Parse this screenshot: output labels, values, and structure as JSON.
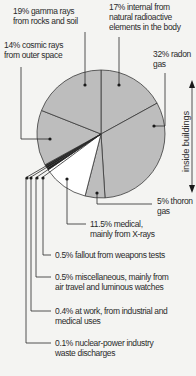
{
  "chart_data": {
    "type": "pie",
    "title": "",
    "start_angle_deg": 0,
    "direction": "clockwise",
    "slices": [
      {
        "key": "internal",
        "value": 17,
        "label_line1": "17% internal from",
        "label_line2": "natural radioactive",
        "label_line3": "elements in the body",
        "fill": "#bdbdbd"
      },
      {
        "key": "radon",
        "value": 32,
        "label_line1": "32% radon",
        "label_line2": "gas",
        "fill": "#bdbdbd"
      },
      {
        "key": "thoron",
        "value": 5,
        "label_line1": "5% thoron",
        "label_line2": "gas",
        "fill": "#bdbdbd"
      },
      {
        "key": "medical",
        "value": 11.5,
        "label_line1": "11.5% medical,",
        "label_line2": "mainly from X-rays",
        "fill": "#ffffff"
      },
      {
        "key": "fallout",
        "value": 0.5,
        "label_line1": "0.5% fallout from weapons tests",
        "fill": "#1a1a1a"
      },
      {
        "key": "misc",
        "value": 0.5,
        "label_line1": "0.5% miscellaneous, mainly from",
        "label_line2": "air travel and luminous watches",
        "fill": "#1a1a1a"
      },
      {
        "key": "work",
        "value": 0.4,
        "label_line1": "0.4% at work, from industrial and",
        "label_line2": "medical uses",
        "fill": "#1a1a1a"
      },
      {
        "key": "nuclear",
        "value": 0.1,
        "label_line1": "0.1% nuclear-power industry",
        "label_line2": "waste discharges",
        "fill": "#1a1a1a"
      },
      {
        "key": "cosmic",
        "value": 14,
        "label_line1": "14% cosmic rays",
        "label_line2": "from outer space",
        "fill": "#bdbdbd"
      },
      {
        "key": "gamma",
        "value": 19,
        "label_line1": "19% gamma rays",
        "label_line2": "from rocks and soil",
        "fill": "#bdbdbd"
      }
    ],
    "annotation": {
      "text": "inside buildings",
      "spans": [
        "radon",
        "thoron"
      ]
    }
  },
  "labels": {
    "gamma": {
      "l1": "19% gamma rays",
      "l2": "from rocks and soil"
    },
    "internal": {
      "l1": "17% internal from",
      "l2": "natural radioactive",
      "l3": "elements in the body"
    },
    "cosmic": {
      "l1": "14% cosmic rays",
      "l2": "from outer space"
    },
    "radon": {
      "l1": "32% radon",
      "l2": "gas"
    },
    "thoron": {
      "l1": "5% thoron",
      "l2": "gas"
    },
    "medical": {
      "l1": "11.5% medical,",
      "l2": "mainly from X-rays"
    },
    "fallout": {
      "l1": "0.5% fallout from weapons tests"
    },
    "misc": {
      "l1": "0.5% miscellaneous, mainly from",
      "l2": "air travel and luminous watches"
    },
    "work": {
      "l1": "0.4% at work, from industrial and",
      "l2": "medical uses"
    },
    "nuclear": {
      "l1": "0.1% nuclear-power industry",
      "l2": "waste discharges"
    },
    "side": "inside buildings"
  },
  "colors": {
    "slice": "#bdbdbd",
    "medical": "#ffffff",
    "line": "#2a2a2a",
    "background": "#f4f4f2"
  }
}
